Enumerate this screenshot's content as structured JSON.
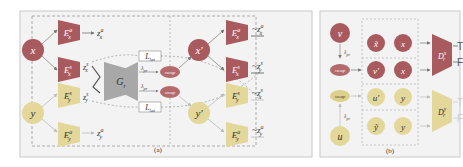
{
  "colors": {
    "dark_red": "#a85a5e",
    "dark_red_node": "#b05a5c",
    "light_yellow": "#e3d79a",
    "light_yellow_node": "#ddd08a",
    "swap": "#b46a6c",
    "panel_border": "#c8c8c8",
    "panel_bg": "#f3f3f3",
    "dash": "#8c8c8c"
  },
  "panel_a": {
    "caption": "(a)",
    "inputs": {
      "x": "x",
      "y": "y"
    },
    "encoders": {
      "ex_a": {
        "base": "E",
        "sup": "a",
        "sub": "x"
      },
      "ex_s": {
        "base": "E",
        "sup": "s",
        "sub": "x"
      },
      "ey_s": {
        "base": "E",
        "sup": "s",
        "sub": "y"
      },
      "ey_a": {
        "base": "E",
        "sup": "a",
        "sub": "y"
      }
    },
    "latents": {
      "zx_a": {
        "base": "z",
        "sup": "a",
        "sub": "x"
      },
      "zx_s": {
        "base": "z",
        "sup": "s",
        "sub": "x"
      },
      "zy_s": {
        "base": "z",
        "sup": "s",
        "sub": "y"
      },
      "zy_a": {
        "base": "z",
        "sup": "a",
        "sub": "y"
      }
    },
    "generator": {
      "base": "G",
      "sub": "r"
    },
    "loss": {
      "base": "L",
      "sub": "lat"
    },
    "lambda": {
      "base": "λ",
      "sub": "pr"
    },
    "swap_label": "swap",
    "outputs": {
      "x_prime": "x'",
      "y_prime": "y'"
    },
    "right_encoders": {
      "ex_a": {
        "base": "E",
        "sup": "a",
        "sub": "x"
      },
      "ex_s": {
        "base": "E",
        "sup": "s",
        "sub": "x"
      },
      "ey_s": {
        "base": "E",
        "sup": "s",
        "sub": "y"
      },
      "ey_a": {
        "base": "E",
        "sup": "a",
        "sub": "y"
      }
    },
    "right_latents": {
      "zx_a": {
        "prefix": "~",
        "base": "z",
        "sup": "a",
        "sub": "x"
      },
      "zy_s": {
        "prefix": "~",
        "base": "z",
        "sup": "s",
        "sub": "y"
      },
      "zx_s": {
        "prefix": "~",
        "base": "z",
        "sup": "s",
        "sub": "x"
      },
      "zy_a": {
        "prefix": "~",
        "base": "z",
        "sup": "a",
        "sub": "y"
      }
    }
  },
  "panel_b": {
    "caption": "(b)",
    "v": "v",
    "u": "u",
    "swap_label": "swap",
    "lambda": {
      "base": "λ",
      "sub": "pr"
    },
    "pairs": [
      {
        "left": "x̃",
        "right": "x",
        "tone": "dark"
      },
      {
        "left": "v'",
        "right": "x",
        "tone": "dark"
      },
      {
        "left": "u'",
        "right": "y",
        "tone": "light"
      },
      {
        "left": "ỹ",
        "right": "y",
        "tone": "light"
      }
    ],
    "discriminators": {
      "dx": {
        "base": "D",
        "sup": "x",
        "sub": "r",
        "out_true": "T",
        "out_false": "F"
      },
      "dy": {
        "base": "D",
        "sup": "y",
        "sub": "r",
        "out_true": "T",
        "out_false": "F"
      }
    }
  }
}
